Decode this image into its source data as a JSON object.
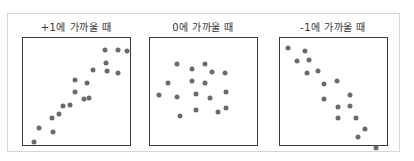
{
  "panels": [
    {
      "title": "+1에 가까울 때",
      "left": 22
    },
    {
      "title": "0에 가까울 때",
      "left": 149
    },
    {
      "title": "-1에 가까울 때",
      "left": 279
    }
  ],
  "chart_data": [
    {
      "type": "scatter",
      "title": "+1에 가까울 때",
      "xlabel": "",
      "ylabel": "",
      "points_px": [
        [
          11,
          104
        ],
        [
          16,
          90
        ],
        [
          29,
          80
        ],
        [
          30,
          94
        ],
        [
          40,
          68
        ],
        [
          36,
          76
        ],
        [
          47,
          67
        ],
        [
          52,
          42
        ],
        [
          52,
          54
        ],
        [
          61,
          61
        ],
        [
          64,
          45
        ],
        [
          66,
          60
        ],
        [
          70,
          32
        ],
        [
          84,
          33
        ],
        [
          82,
          12
        ],
        [
          83,
          25
        ],
        [
          95,
          35
        ],
        [
          95,
          12
        ],
        [
          104,
          13
        ]
      ]
    },
    {
      "type": "scatter",
      "title": "0에 가까울 때",
      "xlabel": "",
      "ylabel": "",
      "points_px": [
        [
          9,
          57
        ],
        [
          18,
          45
        ],
        [
          27,
          26
        ],
        [
          27,
          59
        ],
        [
          30,
          78
        ],
        [
          42,
          31
        ],
        [
          42,
          43
        ],
        [
          46,
          56
        ],
        [
          46,
          72
        ],
        [
          55,
          26
        ],
        [
          55,
          45
        ],
        [
          60,
          60
        ],
        [
          62,
          34
        ],
        [
          68,
          74
        ],
        [
          75,
          35
        ],
        [
          76,
          54
        ],
        [
          76,
          70
        ]
      ]
    },
    {
      "type": "scatter",
      "title": "-1에 가까울 때",
      "xlabel": "",
      "ylabel": "",
      "points_px": [
        [
          8,
          10
        ],
        [
          17,
          23
        ],
        [
          25,
          13
        ],
        [
          27,
          35
        ],
        [
          29,
          22
        ],
        [
          38,
          33
        ],
        [
          44,
          46
        ],
        [
          44,
          61
        ],
        [
          57,
          43
        ],
        [
          58,
          69
        ],
        [
          58,
          80
        ],
        [
          70,
          57
        ],
        [
          70,
          68
        ],
        [
          76,
          80
        ],
        [
          78,
          99
        ],
        [
          85,
          91
        ],
        [
          96,
          110
        ]
      ]
    }
  ]
}
